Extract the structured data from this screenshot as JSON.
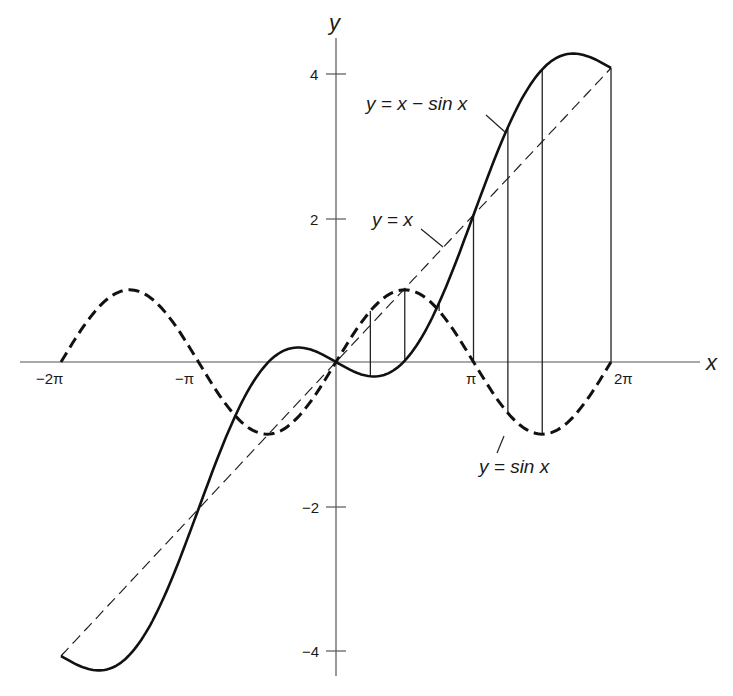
{
  "chart_data": {
    "type": "line",
    "title": "",
    "xlabel": "x",
    "ylabel": "y",
    "x_ticks": [
      {
        "value": -6.2832,
        "label": "−2π"
      },
      {
        "value": -3.1416,
        "label": "−π"
      },
      {
        "value": 3.1416,
        "label": "π"
      },
      {
        "value": 6.2832,
        "label": "2π"
      }
    ],
    "y_ticks": [
      {
        "value": 4,
        "label": "4"
      },
      {
        "value": 2,
        "label": "2"
      },
      {
        "value": -2,
        "label": "−2"
      },
      {
        "value": -4,
        "label": "−4"
      }
    ],
    "xlim": [
      -7,
      8.5
    ],
    "ylim": [
      -4.5,
      5
    ],
    "grid": false,
    "series": [
      {
        "name": "y = x − sin x",
        "style": "solid-thick",
        "domain": [
          -6.2832,
          6.2832
        ]
      },
      {
        "name": "y = x",
        "style": "dashed-thin",
        "domain": [
          -6.2832,
          6.2832
        ]
      },
      {
        "name": "y = sin x",
        "style": "dashed-thick",
        "domain": [
          -6.2832,
          6.2832
        ]
      }
    ],
    "projection_lines_x": [
      0.785,
      1.571,
      2.356,
      3.1416,
      3.927,
      4.712,
      6.2832
    ],
    "annotations": [
      {
        "text": "y = x − sin x",
        "target": "solid curve"
      },
      {
        "text": "y = x",
        "target": "dashed line"
      },
      {
        "text": "y = sin x",
        "target": "dashed sine curve"
      }
    ]
  },
  "axis": {
    "x_label": "x",
    "y_label": "y"
  },
  "labels": {
    "curve_x_minus_sin": "y = x − sin x",
    "line_y_eq_x": "y = x",
    "curve_sin": "y = sin x"
  },
  "ticks": {
    "x_neg2pi": "−2π",
    "x_negpi": "−π",
    "x_pi": "π",
    "x_2pi": "2π",
    "y_4": "4",
    "y_2": "2",
    "y_neg2": "−2",
    "y_neg4": "−4"
  },
  "colors": {
    "ink": "#1a1a1a",
    "axis": "#555555"
  }
}
